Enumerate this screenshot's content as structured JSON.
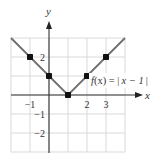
{
  "chart_data": {
    "type": "line",
    "title": "",
    "xlabel": "x",
    "ylabel": "y",
    "xlim": [
      -2,
      4
    ],
    "ylim": [
      -3,
      3
    ],
    "grid": true,
    "x_ticks": [
      {
        "value": -1,
        "label": "−1"
      },
      {
        "value": 2,
        "label": "2"
      },
      {
        "value": 3,
        "label": "3"
      }
    ],
    "y_ticks": [
      {
        "value": 2,
        "label": "2"
      },
      {
        "value": -1,
        "label": "−1"
      },
      {
        "value": -2,
        "label": "−2"
      }
    ],
    "series": [
      {
        "name": "f(x) = |x − 1|",
        "line": [
          [
            -2,
            3
          ],
          [
            1,
            0
          ],
          [
            4,
            3
          ]
        ],
        "points": [
          [
            -1,
            2
          ],
          [
            0,
            1
          ],
          [
            1,
            0
          ],
          [
            2,
            1
          ],
          [
            3,
            2
          ]
        ]
      }
    ],
    "annotation": {
      "prefix": "f",
      "arg": "(x) = ",
      "abs_open": "|",
      "inner": "x − 1",
      "abs_close": "|"
    },
    "colors": {
      "grid": "#d9d9d9",
      "axis": "#333333",
      "line": "#6e6e6e",
      "point": "#111111"
    }
  }
}
